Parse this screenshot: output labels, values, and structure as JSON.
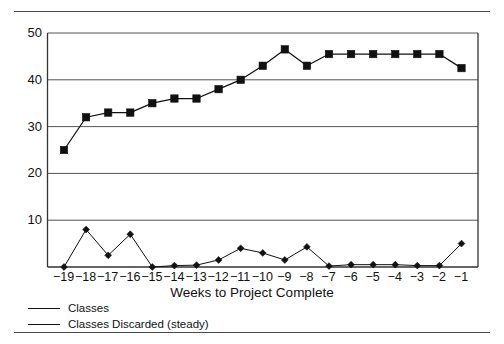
{
  "chart_data": {
    "type": "line",
    "title": "",
    "xlabel": "Weeks to Project Complete",
    "ylabel": "",
    "categories": [
      "-19",
      "-18",
      "-17",
      "-16",
      "-15",
      "-14",
      "-13",
      "-12",
      "-11",
      "-10",
      "-9",
      "-8",
      "-7",
      "-6",
      "-5",
      "-4",
      "-3",
      "-2",
      "-1"
    ],
    "x": [
      -19,
      -18,
      -17,
      -16,
      -15,
      -14,
      -13,
      -12,
      -11,
      -10,
      -9,
      -8,
      -7,
      -6,
      -5,
      -4,
      -3,
      -2,
      -1
    ],
    "series": [
      {
        "name": "Classes",
        "marker": "square",
        "values": [
          25,
          32,
          33,
          33,
          35,
          36,
          36,
          38,
          40,
          43,
          46.5,
          43,
          45.5,
          45.5,
          45.5,
          45.5,
          45.5,
          45.5,
          42.5
        ]
      },
      {
        "name": "Classes Discarded (steady)",
        "marker": "diamond",
        "values": [
          0,
          8,
          2.5,
          7,
          0,
          0.3,
          0.4,
          1.5,
          4,
          3,
          1.5,
          4.3,
          0.2,
          0.5,
          0.5,
          0.5,
          0.3,
          0.3,
          5
        ]
      }
    ],
    "ylim": [
      0,
      50
    ],
    "yticks": [
      10,
      20,
      30,
      40,
      50
    ],
    "ytick_labels": [
      "10",
      "20",
      "30",
      "40",
      "50"
    ],
    "xlim": [
      -19.6,
      -0.4
    ],
    "grid": "horizontal",
    "legend_position": "below-left",
    "colors": {
      "line": "#111111",
      "marker": "#111111",
      "grid": "#555555",
      "frame": "#333333",
      "rule": "#4a4a4a"
    }
  },
  "legend": {
    "items": [
      {
        "label": "Classes",
        "marker": "square"
      },
      {
        "label": "Classes Discarded (steady)",
        "marker": "diamond"
      }
    ]
  },
  "axis": {
    "x_title": "Weeks to Project Complete"
  }
}
